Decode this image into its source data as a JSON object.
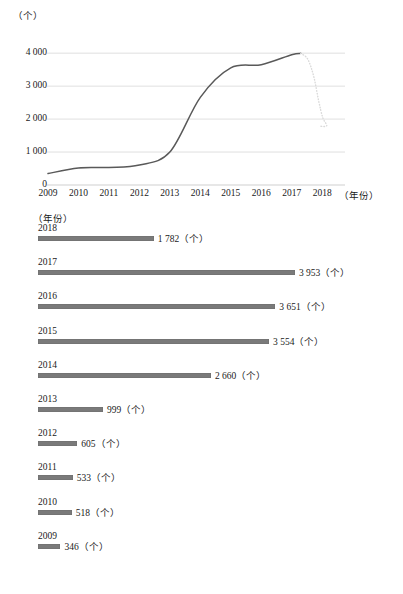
{
  "chart_data": [
    {
      "type": "line",
      "title": "",
      "xlabel": "（年份）",
      "ylabel": "（个）",
      "x": [
        2009,
        2010,
        2011,
        2012,
        2013,
        2014,
        2015,
        2016,
        2017,
        2018
      ],
      "x_ticks": [
        "2009",
        "2010",
        "2011",
        "2012",
        "2013",
        "2014",
        "2015",
        "2016",
        "2017",
        "2018"
      ],
      "y_ticks": [
        "0",
        "1 000",
        "2 000",
        "3 000",
        "4 000"
      ],
      "y_tick_values": [
        0,
        1000,
        2000,
        3000,
        4000
      ],
      "ylim": [
        0,
        4400
      ],
      "grid": true,
      "legend": "none",
      "series": [
        {
          "name": "累计（个）",
          "style": "solid",
          "color": "#595959",
          "values": [
            346,
            518,
            533,
            605,
            999,
            2660,
            3554,
            3651,
            3953,
            1782
          ]
        }
      ],
      "annotations": [
        {
          "text": "2017 年后以浅色虚线下降至 2018 年数值",
          "type": "dotted-segment",
          "from_year": 2017,
          "to_year": 2018,
          "from_value": 3953,
          "to_value": 1782,
          "color": "#d8d8d8"
        }
      ]
    },
    {
      "type": "bar",
      "orientation": "horizontal",
      "title": "",
      "xlabel": "（个）",
      "ylabel": "（年份）",
      "unit_header": "（年份）",
      "value_unit": "（个）",
      "bar_color": "#7a7a7a",
      "xlim": [
        0,
        3953
      ],
      "grid": false,
      "categories": [
        "2018",
        "2017",
        "2016",
        "2015",
        "2014",
        "2013",
        "2012",
        "2011",
        "2010",
        "2009"
      ],
      "values": [
        1782,
        3953,
        3651,
        3554,
        2660,
        999,
        605,
        533,
        518,
        346
      ],
      "value_labels": [
        "1 782（个）",
        "3 953（个）",
        "3 651（个）",
        "3 554（个）",
        "2 660（个）",
        "999（个）",
        "605（个）",
        "533（个）",
        "518（个）",
        "346（个）"
      ]
    }
  ]
}
